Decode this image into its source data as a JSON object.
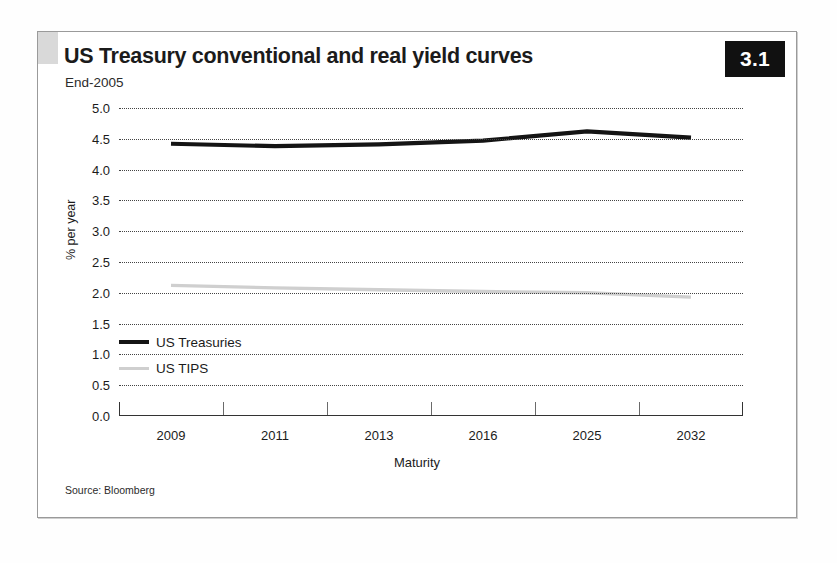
{
  "card": {
    "title": "US Treasury conventional and real yield curves",
    "subtitle": "End-2005",
    "badge": "3.1",
    "source": "Source: Bloomberg"
  },
  "chart_data": {
    "type": "line",
    "title": "US Treasury conventional and real yield curves",
    "subtitle": "End-2005",
    "xlabel": "Maturity",
    "ylabel": "% per year",
    "categories": [
      "2009",
      "2011",
      "2013",
      "2016",
      "2025",
      "2032"
    ],
    "ylim": [
      0.0,
      5.0
    ],
    "ytick_labels": [
      "0.0",
      "0.5",
      "1.0",
      "1.5",
      "2.0",
      "2.5",
      "3.0",
      "3.5",
      "4.0",
      "4.5",
      "5.0"
    ],
    "ytick_values": [
      0.0,
      0.5,
      1.0,
      1.5,
      2.0,
      2.5,
      3.0,
      3.5,
      4.0,
      4.5,
      5.0
    ],
    "ystep": 0.5,
    "grid": true,
    "grid_style": "dotted",
    "legend_position": "inside-lower-left",
    "series": [
      {
        "name": "US Treasuries",
        "color": "#141414",
        "width": 4.2,
        "values": [
          4.42,
          4.38,
          4.41,
          4.47,
          4.62,
          4.52
        ]
      },
      {
        "name": "US TIPS",
        "color": "#cfcfcf",
        "width": 3.4,
        "values": [
          2.12,
          2.08,
          2.05,
          2.02,
          2.0,
          1.93
        ]
      }
    ]
  }
}
